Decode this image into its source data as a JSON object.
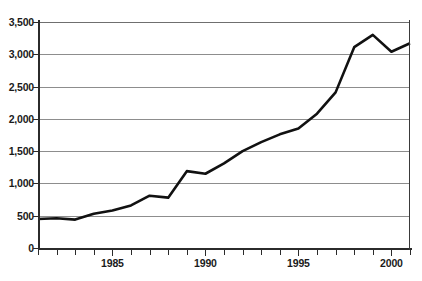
{
  "chart_data": {
    "type": "line",
    "title": "",
    "subtitle": "",
    "xlabel": "",
    "ylabel": "",
    "xlim": [
      1981,
      2001
    ],
    "ylim": [
      0,
      3500
    ],
    "grid": true,
    "legend": false,
    "legend_position": "none",
    "y_ticks": [
      0,
      500,
      1000,
      1500,
      2000,
      2500,
      3000,
      3500
    ],
    "y_tick_labels": [
      "0",
      "500",
      "1,000",
      "1,500",
      "2,000",
      "2,500",
      "3,000",
      "3,500"
    ],
    "x_ticks": [
      1981,
      1982,
      1983,
      1984,
      1985,
      1986,
      1987,
      1988,
      1989,
      1990,
      1991,
      1992,
      1993,
      1994,
      1995,
      1996,
      1997,
      1998,
      1999,
      2000,
      2001
    ],
    "x_tick_labels": [
      "1985",
      "1990",
      "1995",
      "2000"
    ],
    "x_major_ticks": [
      1985,
      1990,
      1995,
      2000
    ],
    "series": [
      {
        "name": "series-1",
        "color": "#111111",
        "x": [
          1981,
          1982,
          1983,
          1984,
          1985,
          1986,
          1987,
          1988,
          1989,
          1990,
          1991,
          1992,
          1993,
          1994,
          1995,
          1996,
          1997,
          1998,
          1999,
          2000,
          2001
        ],
        "values": [
          450,
          460,
          440,
          530,
          580,
          660,
          810,
          780,
          1190,
          1150,
          1310,
          1500,
          1640,
          1760,
          1850,
          2080,
          2410,
          3110,
          3300,
          3040,
          3170
        ]
      }
    ],
    "colors": {
      "line": "#111111",
      "gridline": "#8d8d8d",
      "axis": "#2b2b2b",
      "text": "#1a1a1a",
      "background": "#ffffff"
    }
  }
}
